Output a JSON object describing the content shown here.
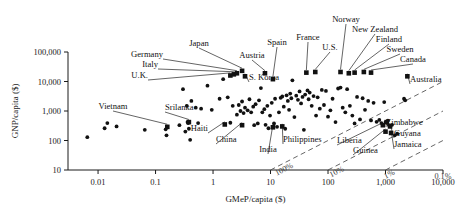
{
  "chart_data": {
    "type": "scatter",
    "title": "",
    "xlabel": "GMeP/capita ($)",
    "ylabel": "GNP/capita ($)",
    "xscale": "log",
    "yscale": "log",
    "xlim": [
      0.003,
      10000
    ],
    "ylim": [
      10,
      100000
    ],
    "grid": false,
    "legend": "none",
    "xticks": [
      "0.01",
      "0.1",
      "1",
      "10",
      "100",
      "1,000",
      "10,000"
    ],
    "xtick_values": [
      0.01,
      0.1,
      1,
      10,
      100,
      1000,
      10000
    ],
    "yticks": [
      "10",
      "100",
      "1,000",
      "10,000",
      "100,000"
    ],
    "ytick_values": [
      10,
      100,
      1000,
      10000,
      100000
    ],
    "ratio_lines": [
      {
        "label": "0.1%",
        "ratio": 0.001
      },
      {
        "label": "1%",
        "ratio": 0.01
      },
      {
        "label": "10%",
        "ratio": 0.1
      },
      {
        "label": "100%",
        "ratio": 1.0
      }
    ],
    "labeled_points": [
      {
        "name": "U.K.",
        "x": 2.0,
        "y": 16000,
        "lx": 148,
        "ly": 78,
        "anchor": "end"
      },
      {
        "name": "Italy",
        "x": 2.3,
        "y": 17500,
        "lx": 158,
        "ly": 67,
        "anchor": "end"
      },
      {
        "name": "Germany",
        "x": 2.6,
        "y": 19000,
        "lx": 163,
        "ly": 57,
        "anchor": "end"
      },
      {
        "name": "Japan",
        "x": 3.2,
        "y": 23000,
        "lx": 199,
        "ly": 46,
        "anchor": "middle"
      },
      {
        "name": "S. Korea",
        "x": 3.6,
        "y": 15000,
        "lx": 249,
        "ly": 80,
        "anchor": "start"
      },
      {
        "name": "Austria",
        "x": 8.0,
        "y": 19000,
        "lx": 252,
        "ly": 58,
        "anchor": "middle"
      },
      {
        "name": "Spain",
        "x": 11.0,
        "y": 12000,
        "lx": 277,
        "ly": 45,
        "anchor": "middle"
      },
      {
        "name": "France",
        "x": 42.0,
        "y": 20000,
        "lx": 308,
        "ly": 40,
        "anchor": "middle"
      },
      {
        "name": "U.S.",
        "x": 60.0,
        "y": 21000,
        "lx": 330,
        "ly": 50,
        "anchor": "middle"
      },
      {
        "name": "Norway",
        "x": 165.0,
        "y": 21000,
        "lx": 346,
        "ly": 22,
        "anchor": "middle"
      },
      {
        "name": "New Zealand",
        "x": 230.0,
        "y": 19000,
        "lx": 375,
        "ly": 32,
        "anchor": "middle"
      },
      {
        "name": "Finland",
        "x": 290.0,
        "y": 20000,
        "lx": 389,
        "ly": 42,
        "anchor": "middle"
      },
      {
        "name": "Sweden",
        "x": 420.0,
        "y": 21000,
        "lx": 400,
        "ly": 52,
        "anchor": "middle"
      },
      {
        "name": "Canada",
        "x": 560.0,
        "y": 20000,
        "lx": 413,
        "ly": 62,
        "anchor": "middle"
      },
      {
        "name": "Australia",
        "x": 2400.0,
        "y": 15000,
        "lx": 410,
        "ly": 82,
        "anchor": "start"
      },
      {
        "name": "Vietnam",
        "x": 0.16,
        "y": 290,
        "lx": 113,
        "ly": 109,
        "anchor": "middle"
      },
      {
        "name": "Srilanka",
        "x": 0.38,
        "y": 420,
        "lx": 165,
        "ly": 110,
        "anchor": "start"
      },
      {
        "name": "Haiti",
        "x": 1.6,
        "y": 350,
        "lx": 208,
        "ly": 131,
        "anchor": "end"
      },
      {
        "name": "China",
        "x": 3.2,
        "y": 330,
        "lx": 216,
        "ly": 142,
        "anchor": "start"
      },
      {
        "name": "India",
        "x": 11.0,
        "y": 280,
        "lx": 268,
        "ly": 152,
        "anchor": "middle"
      },
      {
        "name": "Philippines",
        "x": 16.0,
        "y": 300,
        "lx": 283,
        "ly": 142,
        "anchor": "start"
      },
      {
        "name": "Liberia",
        "x": 900.0,
        "y": 330,
        "lx": 337,
        "ly": 143,
        "anchor": "start"
      },
      {
        "name": "Guinea",
        "x": 1000.0,
        "y": 200,
        "lx": 353,
        "ly": 153,
        "anchor": "start"
      },
      {
        "name": "Zimbabwe",
        "x": 1050.0,
        "y": 420,
        "lx": 386,
        "ly": 125,
        "anchor": "start"
      },
      {
        "name": "Guyana",
        "x": 1200.0,
        "y": 300,
        "lx": 394,
        "ly": 136,
        "anchor": "start"
      },
      {
        "name": "Jamaica",
        "x": 1250.0,
        "y": 180,
        "lx": 394,
        "ly": 147,
        "anchor": "start"
      }
    ],
    "points": [
      {
        "x": 0.0065,
        "y": 130
      },
      {
        "x": 0.013,
        "y": 260
      },
      {
        "x": 0.0145,
        "y": 390
      },
      {
        "x": 0.021,
        "y": 300
      },
      {
        "x": 0.065,
        "y": 230
      },
      {
        "x": 0.15,
        "y": 240
      },
      {
        "x": 0.155,
        "y": 150
      },
      {
        "x": 0.26,
        "y": 330
      },
      {
        "x": 0.3,
        "y": 5500
      },
      {
        "x": 0.33,
        "y": 200
      },
      {
        "x": 0.35,
        "y": 1500
      },
      {
        "x": 0.36,
        "y": 420
      },
      {
        "x": 0.37,
        "y": 390
      },
      {
        "x": 0.38,
        "y": 250
      },
      {
        "x": 0.4,
        "y": 105
      },
      {
        "x": 0.42,
        "y": 2200
      },
      {
        "x": 0.5,
        "y": 1300
      },
      {
        "x": 0.55,
        "y": 390
      },
      {
        "x": 0.62,
        "y": 1200
      },
      {
        "x": 0.8,
        "y": 7200
      },
      {
        "x": 0.95,
        "y": 1100
      },
      {
        "x": 1.3,
        "y": 2600
      },
      {
        "x": 1.5,
        "y": 12000
      },
      {
        "x": 1.8,
        "y": 2900
      },
      {
        "x": 2.0,
        "y": 400
      },
      {
        "x": 2.2,
        "y": 1500
      },
      {
        "x": 2.6,
        "y": 750
      },
      {
        "x": 2.8,
        "y": 1600
      },
      {
        "x": 3.0,
        "y": 1000
      },
      {
        "x": 3.2,
        "y": 2100
      },
      {
        "x": 3.4,
        "y": 850
      },
      {
        "x": 3.6,
        "y": 1300
      },
      {
        "x": 4.0,
        "y": 1050
      },
      {
        "x": 4.3,
        "y": 2500
      },
      {
        "x": 4.6,
        "y": 900
      },
      {
        "x": 5.0,
        "y": 1400
      },
      {
        "x": 5.2,
        "y": 330
      },
      {
        "x": 5.5,
        "y": 1700
      },
      {
        "x": 6.0,
        "y": 380
      },
      {
        "x": 6.3,
        "y": 2300
      },
      {
        "x": 6.8,
        "y": 6000
      },
      {
        "x": 7.2,
        "y": 900
      },
      {
        "x": 7.8,
        "y": 1150
      },
      {
        "x": 8.2,
        "y": 340
      },
      {
        "x": 8.8,
        "y": 1500
      },
      {
        "x": 9.2,
        "y": 260
      },
      {
        "x": 9.8,
        "y": 700
      },
      {
        "x": 10.5,
        "y": 1900
      },
      {
        "x": 11.5,
        "y": 380
      },
      {
        "x": 12.0,
        "y": 2600
      },
      {
        "x": 13.0,
        "y": 290
      },
      {
        "x": 14.0,
        "y": 900
      },
      {
        "x": 15.0,
        "y": 2800
      },
      {
        "x": 16.0,
        "y": 3100
      },
      {
        "x": 17.0,
        "y": 1400
      },
      {
        "x": 18.0,
        "y": 250
      },
      {
        "x": 19.0,
        "y": 3400
      },
      {
        "x": 20.0,
        "y": 2200
      },
      {
        "x": 21.0,
        "y": 1100
      },
      {
        "x": 22.0,
        "y": 3900
      },
      {
        "x": 23.0,
        "y": 2700
      },
      {
        "x": 24.0,
        "y": 11000
      },
      {
        "x": 26.0,
        "y": 620
      },
      {
        "x": 28.0,
        "y": 3300
      },
      {
        "x": 30.0,
        "y": 2400
      },
      {
        "x": 32.0,
        "y": 4600
      },
      {
        "x": 34.0,
        "y": 1800
      },
      {
        "x": 36.0,
        "y": 3000
      },
      {
        "x": 38.0,
        "y": 230
      },
      {
        "x": 40.0,
        "y": 3600
      },
      {
        "x": 44.0,
        "y": 5000
      },
      {
        "x": 46.0,
        "y": 2500
      },
      {
        "x": 48.0,
        "y": 4200
      },
      {
        "x": 52.0,
        "y": 1500
      },
      {
        "x": 56.0,
        "y": 3200
      },
      {
        "x": 62.0,
        "y": 700
      },
      {
        "x": 66.0,
        "y": 2900
      },
      {
        "x": 72.0,
        "y": 1200
      },
      {
        "x": 78.0,
        "y": 5200
      },
      {
        "x": 85.0,
        "y": 1600
      },
      {
        "x": 92.0,
        "y": 4800
      },
      {
        "x": 100.0,
        "y": 640
      },
      {
        "x": 110.0,
        "y": 1050
      },
      {
        "x": 120.0,
        "y": 2600
      },
      {
        "x": 135.0,
        "y": 420
      },
      {
        "x": 150.0,
        "y": 5800
      },
      {
        "x": 165.0,
        "y": 6200
      },
      {
        "x": 180.0,
        "y": 1300
      },
      {
        "x": 200.0,
        "y": 900
      },
      {
        "x": 215.0,
        "y": 5500
      },
      {
        "x": 240.0,
        "y": 1500
      },
      {
        "x": 265.0,
        "y": 700
      },
      {
        "x": 290.0,
        "y": 380
      },
      {
        "x": 320.0,
        "y": 3000
      },
      {
        "x": 360.0,
        "y": 520
      },
      {
        "x": 400.0,
        "y": 2700
      },
      {
        "x": 440.0,
        "y": 1100
      },
      {
        "x": 500.0,
        "y": 2200
      },
      {
        "x": 560.0,
        "y": 480
      },
      {
        "x": 620.0,
        "y": 1900
      },
      {
        "x": 700.0,
        "y": 430
      },
      {
        "x": 780.0,
        "y": 500
      },
      {
        "x": 850.0,
        "y": 390
      },
      {
        "x": 950.0,
        "y": 2000
      },
      {
        "x": 1000.0,
        "y": 420
      },
      {
        "x": 1100.0,
        "y": 470
      },
      {
        "x": 1150.0,
        "y": 330
      },
      {
        "x": 1300.0,
        "y": 340
      },
      {
        "x": 1450.0,
        "y": 150
      },
      {
        "x": 1600.0,
        "y": 170
      },
      {
        "x": 2100.0,
        "y": 2600
      },
      {
        "x": 2200.0,
        "y": 2300
      }
    ]
  }
}
